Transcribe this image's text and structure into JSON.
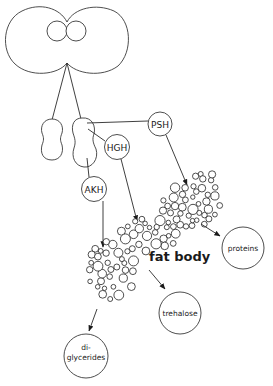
{
  "diagram": {
    "brain": {
      "label": ""
    },
    "glands": [
      {
        "id": "corpus-cardiacum-left"
      },
      {
        "id": "corpus-cardiacum-right"
      }
    ],
    "hormones": [
      {
        "id": "psh",
        "label": "PSH"
      },
      {
        "id": "hgh",
        "label": "HGH"
      },
      {
        "id": "akh",
        "label": "AKH"
      }
    ],
    "target": {
      "label": "fat body"
    },
    "products": [
      {
        "id": "proteins",
        "label": "proteins"
      },
      {
        "id": "trehalose",
        "label": "trehalose"
      },
      {
        "id": "diglycerides",
        "label_line1": "di-",
        "label_line2": "glycerides"
      }
    ],
    "edges": [
      {
        "from": "corpus-cardiacum-right",
        "to": "psh"
      },
      {
        "from": "corpus-cardiacum-right",
        "to": "hgh"
      },
      {
        "from": "corpus-cardiacum-right",
        "to": "akh"
      },
      {
        "from": "psh",
        "to": "fat body"
      },
      {
        "from": "hgh",
        "to": "fat body"
      },
      {
        "from": "akh",
        "to": "fat body"
      },
      {
        "from": "fat body",
        "to": "proteins"
      },
      {
        "from": "fat body",
        "to": "trehalose"
      },
      {
        "from": "fat body",
        "to": "diglycerides"
      }
    ],
    "colors": {
      "stroke": "#222222",
      "background": "#ffffff"
    }
  }
}
